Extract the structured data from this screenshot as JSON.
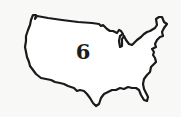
{
  "map": {
    "region": "Continental United States outline",
    "label": "6",
    "outline_color": "#1a1a1a",
    "fill_color": "#ffffff",
    "background_color": "#f8f8f6"
  }
}
